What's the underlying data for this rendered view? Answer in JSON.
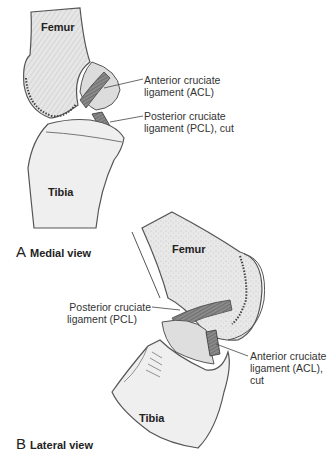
{
  "figure": {
    "panels": [
      {
        "letter": "A",
        "title": "Medial view",
        "bones": {
          "femur": "Femur",
          "tibia": "Tibia"
        },
        "callouts": [
          {
            "line1": "Anterior cruciate",
            "line2": "ligament (ACL)"
          },
          {
            "line1": "Posterior cruciate",
            "line2": "ligament (PCL), cut"
          }
        ]
      },
      {
        "letter": "B",
        "title": "Lateral view",
        "bones": {
          "femur": "Femur",
          "tibia": "Tibia"
        },
        "callouts": [
          {
            "line1": "Posterior cruciate",
            "line2": "ligament (PCL)"
          },
          {
            "line1": "Anterior cruciate",
            "line2": "ligament (ACL),",
            "line3": "cut"
          }
        ]
      }
    ],
    "colors": {
      "bone_fill": "#ececec",
      "bone_stroke": "#555555",
      "cartilage": "#d8d8d8",
      "ligament": "#6a6a6a",
      "leader": "#444444"
    }
  }
}
